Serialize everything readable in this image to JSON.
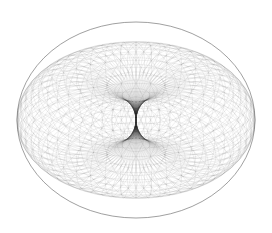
{
  "figure": {
    "background_color": "#ffffff",
    "line_color": "#333333",
    "outline_color": "#555555",
    "canvas": {
      "width": 272,
      "height": 233
    },
    "center": {
      "x": 136,
      "y": 120
    },
    "outer_ellipse": {
      "rx": 119,
      "ry": 98
    },
    "mesh": {
      "major_radius": 1.0,
      "minor_radius": 1.0,
      "u_segments": 48,
      "v_segments": 36,
      "tilt_deg": 52,
      "line_opacity": 0.22,
      "line_width": 0.35
    }
  }
}
